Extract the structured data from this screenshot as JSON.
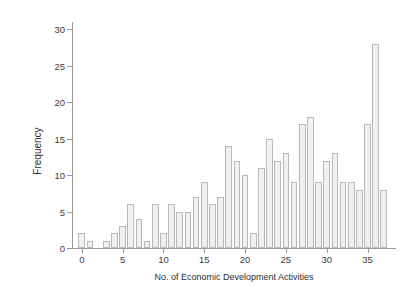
{
  "chart_data": {
    "type": "bar",
    "title": "",
    "xlabel": "No. of Economic Development Activities",
    "ylabel": "Frequency",
    "xlim": [
      -1.2,
      38
    ],
    "ylim": [
      0,
      31
    ],
    "grid": false,
    "legend": null,
    "bar_style": "histogram-like vertical bars, light grey fill with grey outline",
    "xticks": [
      0,
      5,
      10,
      15,
      20,
      25,
      30,
      35
    ],
    "xticklabels": [
      "0",
      "5",
      "10",
      "15",
      "20",
      "25",
      "30",
      "35"
    ],
    "yticks": [
      0,
      5,
      10,
      15,
      20,
      25,
      30
    ],
    "yticklabels": [
      "0",
      "5",
      "10",
      "15",
      "20",
      "25",
      "30"
    ],
    "categories": [
      0,
      1,
      3,
      4,
      5,
      6,
      7,
      8,
      9,
      10,
      11,
      12,
      13,
      14,
      15,
      16,
      17,
      18,
      19,
      20,
      21,
      22,
      23,
      24,
      25,
      26,
      27,
      28,
      29,
      30,
      31,
      32,
      33,
      34,
      35,
      36,
      37
    ],
    "values": [
      2,
      1,
      1,
      2,
      3,
      6,
      4,
      1,
      6,
      2,
      6,
      5,
      5,
      7,
      9,
      6,
      7,
      14,
      12,
      10,
      2,
      11,
      15,
      12,
      13,
      9,
      17,
      18,
      9,
      12,
      13,
      9,
      9,
      8,
      17,
      28,
      8
    ],
    "points": [
      {
        "x": 0,
        "y": 2
      },
      {
        "x": 1,
        "y": 1
      },
      {
        "x": 3,
        "y": 1
      },
      {
        "x": 4,
        "y": 2
      },
      {
        "x": 5,
        "y": 3
      },
      {
        "x": 6,
        "y": 6
      },
      {
        "x": 7,
        "y": 4
      },
      {
        "x": 8,
        "y": 1
      },
      {
        "x": 9,
        "y": 6
      },
      {
        "x": 10,
        "y": 2
      },
      {
        "x": 11,
        "y": 6
      },
      {
        "x": 12,
        "y": 5
      },
      {
        "x": 13,
        "y": 5
      },
      {
        "x": 14,
        "y": 7
      },
      {
        "x": 15,
        "y": 9
      },
      {
        "x": 16,
        "y": 6
      },
      {
        "x": 17,
        "y": 7
      },
      {
        "x": 18,
        "y": 14
      },
      {
        "x": 19,
        "y": 12
      },
      {
        "x": 20,
        "y": 10
      },
      {
        "x": 21,
        "y": 2
      },
      {
        "x": 22,
        "y": 11
      },
      {
        "x": 23,
        "y": 15
      },
      {
        "x": 24,
        "y": 12
      },
      {
        "x": 25,
        "y": 13
      },
      {
        "x": 26,
        "y": 9
      },
      {
        "x": 27,
        "y": 17
      },
      {
        "x": 28,
        "y": 18
      },
      {
        "x": 29,
        "y": 9
      },
      {
        "x": 30,
        "y": 12
      },
      {
        "x": 31,
        "y": 13
      },
      {
        "x": 32,
        "y": 9
      },
      {
        "x": 33,
        "y": 9
      },
      {
        "x": 34,
        "y": 8
      },
      {
        "x": 35,
        "y": 17
      },
      {
        "x": 36,
        "y": 28
      },
      {
        "x": 37,
        "y": 8
      }
    ],
    "colors": {
      "bar_fill": "#f0f0ee",
      "bar_stroke": "#b9b9b9",
      "axis": "#9a9a9a",
      "text": "#2e2e2e",
      "background": "#ffffff"
    }
  }
}
